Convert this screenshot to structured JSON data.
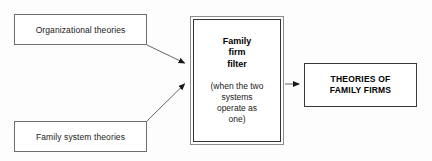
{
  "diagram": {
    "background_color": "#fdfdfd",
    "line_color": "#555555",
    "nodes": {
      "organizational_theories": {
        "label": "Organizational theories",
        "role": "input",
        "border_color": "#6e6e6e"
      },
      "family_system_theories": {
        "label": "Family system theories",
        "role": "input",
        "border_color": "#6e6e6e"
      },
      "family_firm_filter": {
        "title": "Family\nfirm\nfilter",
        "subtitle": "(when the two\nsystems\noperate as\none)",
        "role": "filter",
        "border_color": "#333333"
      },
      "theories_of_family_firms": {
        "label": "THEORIES OF\nFAMILY FIRMS",
        "role": "output",
        "border_color": "#3a3a3a"
      }
    },
    "connectors": [
      {
        "name": "organizational-to-filter",
        "from": "organizational_theories",
        "to": "family_firm_filter",
        "style": "solid-arrow"
      },
      {
        "name": "family-system-to-filter",
        "from": "family_system_theories",
        "to": "family_firm_filter",
        "style": "solid-arrow"
      },
      {
        "name": "filter-to-outcome",
        "from": "family_firm_filter",
        "to": "theories_of_family_firms",
        "style": "solid-arrow"
      }
    ]
  }
}
